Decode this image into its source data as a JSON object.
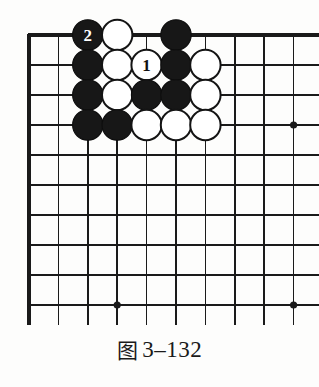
{
  "figure": {
    "caption_cjk": "图",
    "caption_number": "3–132",
    "caption_full": "图 3–132"
  },
  "board": {
    "type": "go-board-corner",
    "visible_columns": 10,
    "visible_rows": 10,
    "origin_x": 29,
    "origin_y": 35,
    "step_x": 29.4,
    "step_y": 30.0,
    "edge_top": true,
    "edge_left": true,
    "line_color": "#1a1a1a",
    "edge_line_width": 3.2,
    "inner_line_width": 1.5,
    "background_color": "#fdfdfc",
    "stone_radius": 15.2,
    "star_point_radius": 3.6,
    "star_points": [
      {
        "col": 3,
        "row": 9,
        "label": "star-point-bottom-left"
      },
      {
        "col": 9,
        "row": 3,
        "label": "star-point-right-upper"
      },
      {
        "col": 9,
        "row": 9,
        "label": "star-point-bottom-right"
      }
    ],
    "stone_colors": {
      "black_fill": "#171717",
      "black_stroke": "#0d0d0d",
      "white_fill": "#ffffff",
      "white_stroke": "#141414",
      "black_label_text": "#ffffff",
      "white_label_text": "#111111"
    },
    "stones": [
      {
        "col": 2,
        "row": 0,
        "color": "black",
        "label": "2",
        "name": "stone-black-move-2"
      },
      {
        "col": 3,
        "row": 0,
        "color": "white",
        "label": "",
        "name": "stone-white-c3r0"
      },
      {
        "col": 5,
        "row": 0,
        "color": "black",
        "label": "",
        "name": "stone-black-c5r0"
      },
      {
        "col": 2,
        "row": 1,
        "color": "black",
        "label": "",
        "name": "stone-black-c2r1"
      },
      {
        "col": 3,
        "row": 1,
        "color": "white",
        "label": "",
        "name": "stone-white-c3r1"
      },
      {
        "col": 4,
        "row": 1,
        "color": "white",
        "label": "1",
        "name": "stone-white-move-1"
      },
      {
        "col": 5,
        "row": 1,
        "color": "black",
        "label": "",
        "name": "stone-black-c5r1"
      },
      {
        "col": 6,
        "row": 1,
        "color": "white",
        "label": "",
        "name": "stone-white-c6r1"
      },
      {
        "col": 2,
        "row": 2,
        "color": "black",
        "label": "",
        "name": "stone-black-c2r2"
      },
      {
        "col": 3,
        "row": 2,
        "color": "white",
        "label": "",
        "name": "stone-white-c3r2"
      },
      {
        "col": 4,
        "row": 2,
        "color": "black",
        "label": "",
        "name": "stone-black-c4r2"
      },
      {
        "col": 5,
        "row": 2,
        "color": "black",
        "label": "",
        "name": "stone-black-c5r2"
      },
      {
        "col": 6,
        "row": 2,
        "color": "white",
        "label": "",
        "name": "stone-white-c6r2"
      },
      {
        "col": 2,
        "row": 3,
        "color": "black",
        "label": "",
        "name": "stone-black-c2r3"
      },
      {
        "col": 3,
        "row": 3,
        "color": "black",
        "label": "",
        "name": "stone-black-c3r3"
      },
      {
        "col": 4,
        "row": 3,
        "color": "white",
        "label": "",
        "name": "stone-white-c4r3"
      },
      {
        "col": 5,
        "row": 3,
        "color": "white",
        "label": "",
        "name": "stone-white-c5r3"
      },
      {
        "col": 6,
        "row": 3,
        "color": "white",
        "label": "",
        "name": "stone-white-c6r3"
      }
    ],
    "move_sequence": [
      {
        "number": "1",
        "color": "white",
        "col": 4,
        "row": 1
      },
      {
        "number": "2",
        "color": "black",
        "col": 2,
        "row": 0
      }
    ]
  }
}
